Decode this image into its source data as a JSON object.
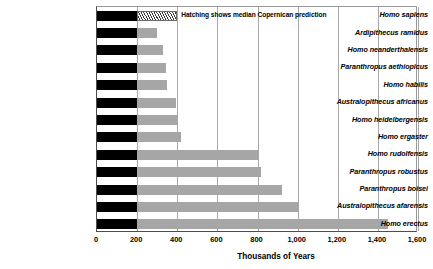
{
  "chart_data": {
    "type": "bar",
    "orientation": "horizontal",
    "title": "",
    "xlabel": "Thousands of Years",
    "ylabel": "",
    "xlim": [
      0,
      1600
    ],
    "xticks": [
      0,
      200,
      400,
      600,
      800,
      1000,
      1200,
      1400,
      1600
    ],
    "xtick_labels": [
      "0",
      "200",
      "400",
      "600",
      "800",
      "1,000",
      "1,200",
      "1,400",
      "1,600"
    ],
    "grid": true,
    "grid_axis": "x",
    "legend": false,
    "annotation": "Hatching shows median Copernican prediction",
    "base_value": 200,
    "categories": [
      "Homo sapiens",
      "Ardipithecus ramidus",
      "Homo neanderthalensis",
      "Paranthropus aethiopicus",
      "Homo habilis",
      "Australopithecus africanus",
      "Homo heidelbergensis",
      "Homo ergaster",
      "Homo rudolfensis",
      "Paranthropus robustus",
      "Paranthropus boisei",
      "Australopithecus afarensis",
      "Homo erectus"
    ],
    "values": [
      400,
      300,
      330,
      345,
      350,
      395,
      400,
      420,
      800,
      815,
      920,
      1000,
      1450
    ],
    "hatched": [
      true,
      false,
      false,
      false,
      false,
      false,
      false,
      false,
      false,
      false,
      false,
      false,
      false
    ],
    "series": [
      {
        "name": "Elapsed duration",
        "color": "#000000",
        "values": [
          200,
          200,
          200,
          200,
          200,
          200,
          200,
          200,
          200,
          200,
          200,
          200,
          200
        ]
      },
      {
        "name": "Remaining / predicted duration",
        "color": "#a6a6a6",
        "values": [
          200,
          100,
          130,
          145,
          150,
          195,
          200,
          220,
          600,
          615,
          720,
          800,
          1250
        ]
      }
    ],
    "colors": {
      "base_bar": "#000000",
      "extension_bar": "#a6a6a6",
      "hatch_line": "#3a3a3a",
      "gridline": "#a8a8a8",
      "axis": "#4d4d4d",
      "text": "#000000",
      "background": "#ffffff"
    }
  }
}
